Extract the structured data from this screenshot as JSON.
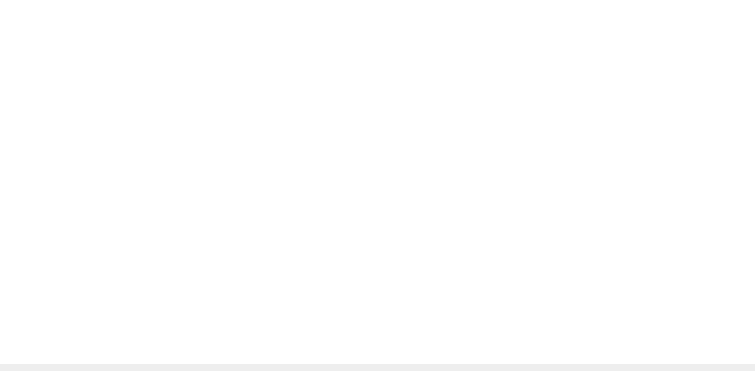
{
  "chart_data": [
    {
      "type": "line",
      "title": "",
      "ylabel": "チックの頻度",
      "xlabel": "",
      "ylim": [
        0,
        80
      ],
      "yticks": [
        0,
        20,
        40,
        60,
        80
      ],
      "grid": false,
      "marker": "open-circle",
      "phases": [
        {
          "label": "A",
          "start": 1,
          "end": 7
        },
        {
          "label": "A1",
          "start": 8,
          "end": 21
        },
        {
          "label": "B1",
          "start": 22,
          "end": 56
        },
        {
          "label": "A2",
          "start": 57,
          "end": 63
        },
        {
          "label": "B2",
          "start": 64,
          "end": 79
        },
        {
          "label": "A3",
          "start": 80,
          "end": 100
        }
      ],
      "phase_lines": [
        7.5,
        21.3,
        56.3,
        63.4,
        79.3
      ],
      "x": [
        1,
        2,
        3,
        4,
        5,
        6,
        7,
        8,
        9,
        10,
        11,
        12,
        13,
        14,
        15,
        16,
        17,
        18,
        19,
        20,
        21,
        22,
        23,
        24,
        25,
        26,
        27,
        28,
        29,
        30,
        31,
        32,
        33,
        34,
        35,
        36,
        37,
        38,
        39,
        40,
        41,
        42,
        43,
        44,
        45,
        46,
        47,
        48,
        49,
        50,
        51,
        52,
        53,
        54,
        55,
        56,
        57,
        58,
        59,
        60,
        61,
        62,
        63,
        64,
        65,
        66,
        67,
        68,
        69,
        70,
        71,
        72,
        73,
        74,
        75,
        76,
        77,
        78,
        79,
        80,
        81,
        82,
        83,
        84,
        85,
        86,
        87,
        88,
        89,
        90,
        91,
        92,
        93,
        94,
        95,
        96,
        97,
        98,
        99,
        100
      ],
      "values": [
        61,
        53,
        60,
        76,
        72,
        65,
        62,
        66,
        59,
        56,
        62,
        59,
        67,
        69,
        60,
        63,
        59,
        66,
        57,
        54,
        62,
        71,
        56,
        41,
        33,
        12,
        11,
        1,
        1,
        1,
        1,
        1,
        9,
        19,
        17,
        21,
        21,
        26,
        38,
        22,
        5,
        3,
        1,
        1,
        1,
        1,
        1,
        1,
        1,
        1,
        1,
        13,
        4,
        5,
        3,
        9,
        5,
        8,
        11,
        7,
        7,
        6,
        10,
        6,
        2,
        6,
        3,
        2,
        5,
        4,
        2,
        3,
        12,
        8,
        20,
        7,
        4,
        4,
        1,
        1,
        2,
        0,
        0,
        0,
        2,
        1,
        0,
        0,
        0,
        0,
        0,
        0,
        0,
        0,
        0,
        0,
        0,
        0,
        0,
        0
      ]
    },
    {
      "type": "line",
      "title": "",
      "ylabel": "セルフ・エフィカシー",
      "xlabel": "(日)",
      "ylim": [
        0,
        4
      ],
      "yticks": [
        0,
        1,
        2,
        3,
        4
      ],
      "xticks": [
        1,
        10,
        20,
        30,
        40,
        50,
        60,
        70,
        80,
        90,
        100
      ],
      "xtick_labels": [
        "1",
        "10",
        "20",
        "30",
        "40",
        "50",
        "60",
        "70",
        "80",
        "90",
        "100"
      ],
      "grid": false,
      "marker": "filled-dot",
      "phase_lines": [
        7.5,
        21.3,
        56.3,
        63.4,
        79.3
      ],
      "x": [
        1,
        2,
        3,
        4,
        5,
        6,
        7,
        8,
        9,
        10,
        11,
        12,
        13,
        14,
        15,
        16,
        17,
        18,
        19,
        20,
        21,
        22,
        23,
        24,
        25,
        26,
        27,
        28,
        29,
        30,
        31,
        32,
        33,
        34,
        35,
        36,
        37,
        38,
        39,
        40,
        41,
        42,
        43,
        44,
        45,
        46,
        47,
        48,
        49,
        50,
        51,
        52,
        53,
        54,
        55,
        56,
        57,
        58,
        59,
        60,
        61,
        62,
        63,
        64,
        65,
        66,
        67,
        68,
        69,
        70,
        71,
        72,
        73,
        74,
        75,
        76,
        77,
        78,
        79,
        80,
        81,
        82,
        83,
        84,
        85,
        86,
        87,
        88,
        89,
        90,
        91,
        92,
        93,
        94,
        95,
        96,
        97,
        98,
        99,
        100
      ],
      "values": [
        0,
        0,
        0,
        0,
        0,
        0,
        0,
        0,
        0,
        0,
        0,
        0,
        0,
        0,
        0,
        0,
        0,
        0,
        0,
        1,
        0,
        0,
        0,
        0,
        0,
        1,
        1,
        1,
        3,
        3,
        3,
        3,
        2,
        2,
        1,
        1,
        1,
        1,
        2,
        0,
        0,
        1,
        0,
        1,
        1,
        2,
        3,
        3,
        3,
        3,
        2,
        1,
        2,
        2,
        3,
        3,
        3,
        2,
        2,
        2,
        3,
        2,
        2,
        3,
        4,
        3,
        4,
        4,
        4,
        4,
        4,
        1,
        1,
        0,
        2,
        3,
        3,
        4,
        4,
        4,
        3,
        4,
        4,
        4,
        3,
        3,
        4,
        3,
        4,
        4,
        4,
        4,
        4,
        4,
        4,
        4,
        4,
        4,
        4,
        4
      ]
    }
  ],
  "labels": {
    "top_ylabel_chars": [
      "チ",
      "ッ",
      "ク",
      "の",
      "頻",
      "度"
    ],
    "bottom_ylabel_chars": [
      "セ",
      "ル",
      "フ",
      "・",
      "エ",
      "フ",
      "ィ",
      "カ",
      "シ",
      "ー"
    ],
    "x_unit": "(日)",
    "phase_main": [
      "A",
      "A",
      "B",
      "A",
      "B",
      "A"
    ],
    "phase_sub": [
      "",
      "1",
      "1",
      "2",
      "2",
      "3"
    ]
  },
  "colors": {
    "ink": "#333333",
    "axis": "#444444",
    "text": "#555555"
  }
}
